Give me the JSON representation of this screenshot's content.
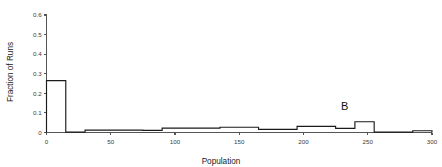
{
  "chart_data": {
    "type": "bar",
    "title": "",
    "xlabel": "Population",
    "ylabel": "Fraction of Runs",
    "xlim": [
      0,
      300
    ],
    "ylim": [
      0,
      0.6
    ],
    "grid": false,
    "legend": null,
    "xticks": [
      0,
      50,
      100,
      150,
      200,
      250,
      300
    ],
    "xtick_labels": [
      "0",
      "50",
      "100",
      "150",
      "200",
      "250",
      "300"
    ],
    "yticks": [
      0,
      0.1,
      0.2,
      0.3,
      0.4,
      0.5,
      0.6
    ],
    "ytick_labels": [
      "0",
      "0.1",
      "0.2",
      "0.3",
      "0.4",
      "0.5",
      "0.6"
    ],
    "bin_width": 15,
    "bin_edges": [
      0,
      15,
      30,
      45,
      60,
      75,
      90,
      105,
      120,
      135,
      150,
      165,
      180,
      195,
      210,
      225,
      240,
      255,
      270,
      285,
      300
    ],
    "categories": [
      "0-15",
      "15-30",
      "30-45",
      "45-60",
      "60-75",
      "75-90",
      "90-105",
      "105-120",
      "120-135",
      "135-150",
      "150-165",
      "165-180",
      "180-195",
      "195-210",
      "210-225",
      "225-240",
      "240-255",
      "255-270",
      "270-285",
      "285-300"
    ],
    "values": [
      0.265,
      0.002,
      0.012,
      0.012,
      0.012,
      0.011,
      0.022,
      0.022,
      0.022,
      0.027,
      0.027,
      0.016,
      0.016,
      0.031,
      0.031,
      0.021,
      0.055,
      0.002,
      0.002,
      0.009
    ],
    "annotations": [
      {
        "text": "B",
        "x": 232,
        "y": 0.115,
        "refers_to_bin": "225-240"
      }
    ]
  }
}
